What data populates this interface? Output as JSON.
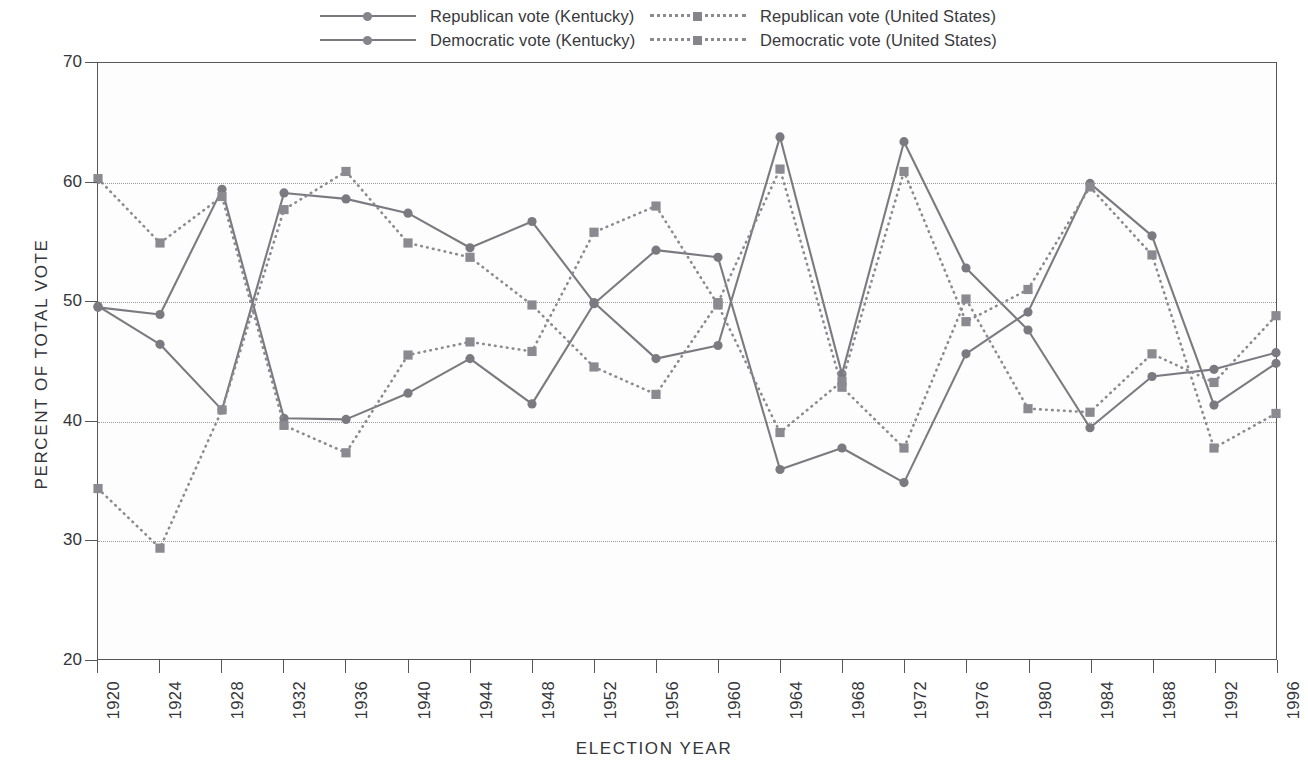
{
  "chart_data": {
    "type": "line",
    "title": "",
    "xlabel": "ELECTION  YEAR",
    "ylabel": "PERCENT  OF  TOTAL  VOTE",
    "xlim": [
      1920,
      1996
    ],
    "ylim": [
      20,
      70
    ],
    "yticks": [
      20,
      30,
      40,
      50,
      60,
      70
    ],
    "grid": "horizontal-dotted",
    "legend_position": "top",
    "categories": [
      1920,
      1924,
      1928,
      1932,
      1936,
      1940,
      1944,
      1948,
      1952,
      1956,
      1960,
      1964,
      1968,
      1972,
      1976,
      1980,
      1984,
      1988,
      1992,
      1996
    ],
    "xticklabels": [
      "1920",
      "1924",
      "1928",
      "1932",
      "1936",
      "1940",
      "1944",
      "1948",
      "1952",
      "1956",
      "1960",
      "1964",
      "1968",
      "1972",
      "1976",
      "1980",
      "1984",
      "1988",
      "1992",
      "1996"
    ],
    "series": [
      {
        "name": "Republican vote (Kentucky)",
        "style": "solid",
        "marker": "circle",
        "color": "#7a7a80",
        "values": [
          49.5,
          48.9,
          59.4,
          40.2,
          40.1,
          42.3,
          45.2,
          41.4,
          49.8,
          54.3,
          53.7,
          35.9,
          37.7,
          34.8,
          45.6,
          49.1,
          59.9,
          55.5,
          41.3,
          44.8
        ]
      },
      {
        "name": "Democratic vote (Kentucky)",
        "style": "solid",
        "marker": "circle",
        "color": "#7a7a80",
        "values": [
          49.6,
          46.4,
          40.9,
          59.1,
          58.6,
          57.4,
          54.5,
          56.7,
          49.9,
          45.2,
          46.3,
          63.8,
          43.9,
          63.4,
          52.8,
          47.6,
          39.4,
          43.7,
          44.3,
          45.7
        ]
      },
      {
        "name": "Republican vote (United States)",
        "style": "dotted",
        "marker": "square",
        "color": "#8a8a90",
        "values": [
          60.3,
          54.9,
          58.8,
          39.6,
          37.3,
          45.5,
          46.6,
          45.8,
          55.8,
          58.0,
          49.7,
          39.0,
          43.3,
          60.9,
          48.3,
          51.0,
          59.6,
          53.9,
          37.7,
          40.6
        ]
      },
      {
        "name": "Democratic vote (United States)",
        "style": "dotted",
        "marker": "square",
        "color": "#8a8a90",
        "values": [
          34.3,
          29.3,
          40.9,
          57.7,
          60.9,
          54.9,
          53.7,
          49.7,
          44.5,
          42.2,
          49.9,
          61.1,
          42.8,
          37.7,
          50.2,
          41.0,
          40.7,
          45.6,
          43.2,
          48.8
        ]
      }
    ]
  },
  "legend": {
    "items": [
      {
        "label": "Republican vote (Kentucky)",
        "style": "solid",
        "marker": "circle"
      },
      {
        "label": "Democratic vote (Kentucky)",
        "style": "solid",
        "marker": "circle"
      },
      {
        "label": "Republican vote (United States)",
        "style": "dotted",
        "marker": "square"
      },
      {
        "label": "Democratic vote (United States)",
        "style": "dotted",
        "marker": "square"
      }
    ]
  },
  "axes": {
    "y_title": "PERCENT  OF  TOTAL  VOTE",
    "x_title": "ELECTION  YEAR"
  }
}
